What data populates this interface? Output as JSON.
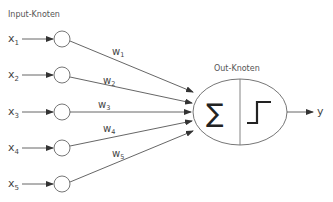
{
  "diagram": {
    "title_input": "Input-Knoten",
    "title_output": "Out-Knoten",
    "inputs": [
      {
        "var": "x",
        "sub": "1",
        "weight": "w",
        "weight_sub": "1",
        "y": 39
      },
      {
        "var": "x",
        "sub": "2",
        "weight": "w",
        "weight_sub": "2",
        "y": 75
      },
      {
        "var": "x",
        "sub": "3",
        "weight": "w",
        "weight_sub": "3",
        "y": 112
      },
      {
        "var": "x",
        "sub": "4",
        "weight": "w",
        "weight_sub": "4",
        "y": 148
      },
      {
        "var": "x",
        "sub": "5",
        "weight": "w",
        "weight_sub": "5",
        "y": 184
      }
    ],
    "sum_symbol": "∑",
    "activation": "step-function",
    "output_label": "y",
    "colors": {
      "stroke": "#555555",
      "text": "#444444",
      "background": "#ffffff"
    }
  }
}
